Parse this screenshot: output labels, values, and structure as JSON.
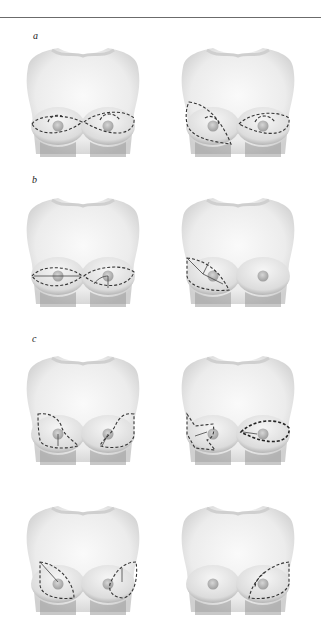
{
  "figure": {
    "panels": [
      {
        "label": "a",
        "illustrations": [
          {
            "id": "a-left",
            "description": "bilateral horizontal elliptical dashed incisions with periareolar arcs"
          },
          {
            "id": "a-right",
            "description": "right oblique lateral dashed wedge, left horizontal elliptical dashed incision"
          }
        ]
      },
      {
        "label": "b",
        "illustrations": [
          {
            "id": "b-left",
            "description": "bilateral inferior horizontal dashed ellipses with solid internal lines"
          },
          {
            "id": "b-right",
            "description": "right oblique dashed wedge with internal lines, left breast unmarked"
          }
        ]
      },
      {
        "label": "c",
        "illustrations": [
          {
            "id": "c-left-1",
            "description": "bilateral curved lateral-to-inferior dashed incisions"
          },
          {
            "id": "c-right-1",
            "description": "right star-shaped dashed pattern, left bold teardrop dashed incision"
          },
          {
            "id": "c-left-2",
            "description": "bilateral lateral vertical dashed ellipses with solid lines"
          },
          {
            "id": "c-right-2",
            "description": "right breast unmarked, left lateral oblique dashed ellipse"
          }
        ]
      }
    ],
    "colors": {
      "skin_shade": "#d9d9d9",
      "skin_dark": "#8a8a8a",
      "dash": "#333333",
      "nipple": "#b8b8b8"
    }
  }
}
